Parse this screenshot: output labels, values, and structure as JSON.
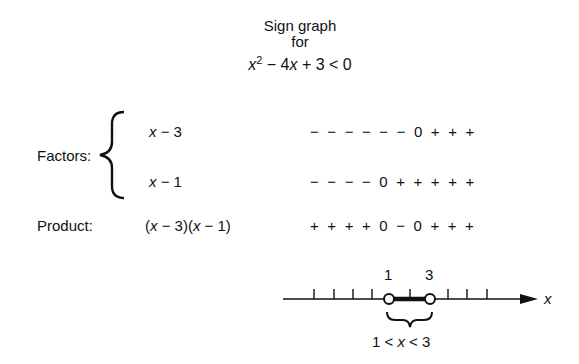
{
  "title": {
    "line1": "Sign graph",
    "line2": "for",
    "inequality": {
      "var": "x",
      "exp": "2",
      "rest": " − 4",
      "var2": "x",
      "tail": " + 3 < 0"
    }
  },
  "factors": {
    "label": "Factors:",
    "items": [
      {
        "var": "x",
        "expr": " − 3",
        "signs": "− − − − − − 0 + + +"
      },
      {
        "var": "x",
        "expr": " − 1",
        "signs": "− − − − 0 + + + + +"
      }
    ]
  },
  "product": {
    "label": "Product:",
    "expr_parts": [
      "(",
      "x",
      " − 3)(",
      "x",
      " − 1)"
    ],
    "signs": "+ + + + 0 − 0 + + +"
  },
  "number_line": {
    "axis_label": "x",
    "points": [
      {
        "label": "1",
        "type": "open"
      },
      {
        "label": "3",
        "type": "open"
      }
    ],
    "solution": {
      "left": "1 < ",
      "var": "x",
      "right": " < 3"
    }
  }
}
